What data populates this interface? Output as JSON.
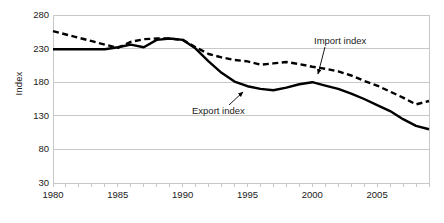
{
  "chart": {
    "ylabel": "Index",
    "xlabel": "",
    "title": ""
  },
  "annotations": {
    "import_label": "Import index",
    "export_label": "Export index"
  },
  "colors": {
    "series_line": "#000000",
    "gridline": "#c8c8c8",
    "axis": "#9a9a9a",
    "text": "#1a1a1a",
    "background": "#ffffff"
  },
  "chart_data": {
    "type": "line",
    "title": "",
    "xlabel": "",
    "ylabel": "Index",
    "grid": "horizontal",
    "legend": "annotations-on-plot",
    "xlim": [
      1980,
      2009
    ],
    "ylim": [
      30,
      280
    ],
    "yticks": [
      30,
      80,
      130,
      180,
      230,
      280
    ],
    "xticks": [
      1980,
      1985,
      1990,
      1995,
      2000,
      2005
    ],
    "x": [
      1980,
      1981,
      1982,
      1983,
      1984,
      1985,
      1986,
      1987,
      1988,
      1989,
      1990,
      1991,
      1992,
      1993,
      1994,
      1995,
      1996,
      1997,
      1998,
      1999,
      2000,
      2001,
      2002,
      2003,
      2004,
      2005,
      2006,
      2007,
      2008,
      2009
    ],
    "series": [
      {
        "name": "Import index",
        "style": "dashed",
        "values": [
          256,
          251,
          246,
          241,
          236,
          231,
          240,
          244,
          245,
          245,
          243,
          232,
          222,
          217,
          213,
          211,
          206,
          208,
          210,
          207,
          203,
          200,
          196,
          190,
          182,
          175,
          166,
          157,
          147,
          152
        ]
      },
      {
        "name": "Export index",
        "style": "solid",
        "values": [
          229,
          229,
          229,
          229,
          229,
          232,
          236,
          232,
          243,
          245,
          243,
          230,
          211,
          194,
          181,
          174,
          170,
          168,
          172,
          177,
          180,
          175,
          170,
          163,
          155,
          146,
          137,
          125,
          115,
          110
        ]
      }
    ]
  }
}
